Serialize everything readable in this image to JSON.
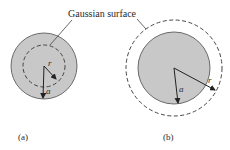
{
  "figure": {
    "callout_label": "Gaussian surface",
    "panel_a": {
      "caption": "(a)",
      "radius_label_inner": "r",
      "radius_label_outer": "a"
    },
    "panel_b": {
      "caption": "(b)",
      "radius_label_inner": "a",
      "radius_label_outer": "r"
    },
    "colors": {
      "sphere_fill": "#c8c8c8",
      "sphere_stroke": "#555555",
      "line": "#333333"
    }
  }
}
